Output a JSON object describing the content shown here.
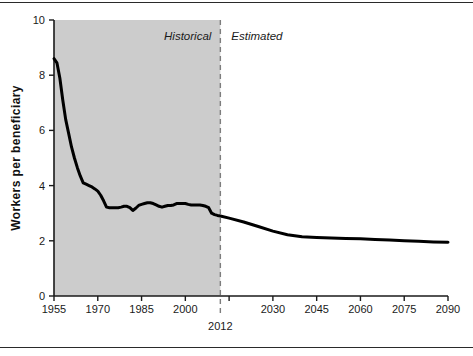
{
  "figure": {
    "background_color": "#ffffff",
    "shaded_band_color": "#cccccc",
    "line_color": "#000000",
    "axis_color": "#1a1a1a",
    "divider_color": "#888888"
  },
  "annotations": {
    "historical_label": "Historical",
    "estimated_label": "Estimated",
    "divider_year_label": "2012"
  },
  "chart_data": {
    "type": "line",
    "title": "",
    "xlabel": "",
    "ylabel": "Workers  per  beneficiary",
    "xlim": [
      1955,
      2090
    ],
    "ylim": [
      0,
      10
    ],
    "xticks": [
      1955,
      1970,
      1985,
      2000,
      2015,
      2030,
      2045,
      2060,
      2075,
      2090
    ],
    "xtick_labels": [
      "1955",
      "1970",
      "1985",
      "2000",
      "",
      "2030",
      "2045",
      "2060",
      "2075",
      "2090"
    ],
    "yticks": [
      0,
      2,
      4,
      6,
      8,
      10
    ],
    "ytick_labels": [
      "0",
      "2",
      "4",
      "6",
      "8",
      "10"
    ],
    "grid": false,
    "legend": "none",
    "divider_x": 2012,
    "shaded_region": {
      "x_start": 1955,
      "x_end": 2012,
      "label": "Historical"
    },
    "unshaded_region": {
      "x_start": 2012,
      "x_end": 2090,
      "label": "Estimated"
    },
    "series": [
      {
        "name": "Workers per beneficiary",
        "x": [
          1955,
          1956,
          1957,
          1958,
          1959,
          1960,
          1961,
          1962,
          1963,
          1964,
          1965,
          1966,
          1967,
          1968,
          1969,
          1970,
          1971,
          1972,
          1973,
          1974,
          1975,
          1976,
          1977,
          1978,
          1979,
          1980,
          1981,
          1982,
          1983,
          1984,
          1985,
          1986,
          1987,
          1988,
          1989,
          1990,
          1991,
          1992,
          1993,
          1994,
          1995,
          1996,
          1997,
          1998,
          1999,
          2000,
          2001,
          2002,
          2003,
          2004,
          2005,
          2006,
          2007,
          2008,
          2009,
          2010,
          2011,
          2012,
          2015,
          2020,
          2025,
          2030,
          2035,
          2040,
          2045,
          2050,
          2055,
          2060,
          2065,
          2070,
          2075,
          2080,
          2085,
          2090
        ],
        "y": [
          8.6,
          8.45,
          7.9,
          7.1,
          6.4,
          5.9,
          5.4,
          5.0,
          4.65,
          4.35,
          4.1,
          4.05,
          4.0,
          3.95,
          3.88,
          3.8,
          3.65,
          3.45,
          3.22,
          3.2,
          3.2,
          3.2,
          3.2,
          3.22,
          3.25,
          3.25,
          3.2,
          3.1,
          3.18,
          3.28,
          3.32,
          3.35,
          3.38,
          3.38,
          3.35,
          3.3,
          3.25,
          3.22,
          3.25,
          3.28,
          3.28,
          3.3,
          3.35,
          3.35,
          3.35,
          3.35,
          3.32,
          3.3,
          3.3,
          3.3,
          3.3,
          3.28,
          3.25,
          3.2,
          3.0,
          2.95,
          2.92,
          2.9,
          2.82,
          2.68,
          2.52,
          2.35,
          2.22,
          2.15,
          2.12,
          2.1,
          2.08,
          2.07,
          2.05,
          2.03,
          2.0,
          1.98,
          1.96,
          1.95
        ]
      }
    ]
  }
}
